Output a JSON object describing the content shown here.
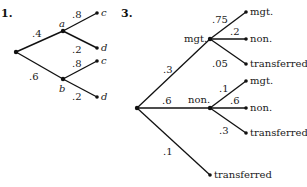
{
  "diagrams": [
    {
      "number": "1.",
      "nodes": {
        "root": {
          "x": 16,
          "y": 52
        },
        "a": {
          "x": 63,
          "y": 31,
          "label": "a"
        },
        "b": {
          "x": 63,
          "y": 79,
          "label": "b"
        },
        "c1": {
          "x": 97,
          "y": 13,
          "label": "c"
        },
        "d1": {
          "x": 97,
          "y": 48,
          "label": "d"
        },
        "c2": {
          "x": 97,
          "y": 61,
          "label": "c"
        },
        "d2": {
          "x": 97,
          "y": 97,
          "label": "d"
        }
      },
      "edges": [
        {
          "from": "root",
          "to": "a",
          "prob": ".4"
        },
        {
          "from": "root",
          "to": "b",
          "prob": ".6"
        },
        {
          "from": "a",
          "to": "c1",
          "prob": ".8"
        },
        {
          "from": "a",
          "to": "d1",
          "prob": ".2"
        },
        {
          "from": "b",
          "to": "c2",
          "prob": ".8"
        },
        {
          "from": "b",
          "to": "d2",
          "prob": ".2"
        }
      ]
    },
    {
      "number": "3.",
      "nodes": {
        "root": {
          "x": 137,
          "y": 108
        },
        "mgt": {
          "x": 210,
          "y": 39,
          "label": "mgt."
        },
        "non": {
          "x": 210,
          "y": 108,
          "label": "non."
        },
        "mgt_mgt": {
          "x": 246,
          "y": 12,
          "label": "mgt."
        },
        "mgt_non": {
          "x": 246,
          "y": 39,
          "label": "non."
        },
        "mgt_tr": {
          "x": 246,
          "y": 64,
          "label": "transferred"
        },
        "non_mgt": {
          "x": 246,
          "y": 81,
          "label": "mgt."
        },
        "non_non": {
          "x": 246,
          "y": 108,
          "label": "non."
        },
        "non_tr": {
          "x": 246,
          "y": 133,
          "label": "transferred"
        },
        "tr": {
          "x": 210,
          "y": 175,
          "label": "transferred"
        }
      },
      "edges": [
        {
          "from": "root",
          "to": "mgt",
          "prob": ".3"
        },
        {
          "from": "root",
          "to": "non",
          "prob": ".6"
        },
        {
          "from": "root",
          "to": "tr",
          "prob": ".1"
        },
        {
          "from": "mgt",
          "to": "mgt_mgt",
          "prob": ".75"
        },
        {
          "from": "mgt",
          "to": "mgt_non",
          "prob": ".2"
        },
        {
          "from": "mgt",
          "to": "mgt_tr",
          "prob": ".05"
        },
        {
          "from": "non",
          "to": "non_mgt",
          "prob": ".1"
        },
        {
          "from": "non",
          "to": "non_non",
          "prob": ".6"
        },
        {
          "from": "non",
          "to": "non_tr",
          "prob": ".3"
        }
      ]
    }
  ]
}
